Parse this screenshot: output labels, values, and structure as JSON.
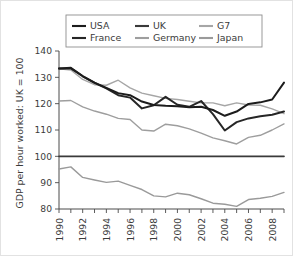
{
  "chart_data": {
    "type": "line",
    "title": "",
    "xlabel": "",
    "ylabel": "GDP per hour worked: UK = 100",
    "xlim": [
      1990,
      2009
    ],
    "ylim": [
      80,
      140
    ],
    "grid": false,
    "legend_position": "top",
    "x_tick_labels": [
      "1990",
      "1992",
      "1994",
      "1996",
      "1998",
      "2000",
      "2002",
      "2004",
      "2006",
      "2008"
    ],
    "x_tick_values": [
      1990,
      1992,
      1994,
      1996,
      1998,
      2000,
      2002,
      2004,
      2006,
      2008
    ],
    "x_minor_ticks": [
      1990,
      1991,
      1992,
      1993,
      1994,
      1995,
      1996,
      1997,
      1998,
      1999,
      2000,
      2001,
      2002,
      2003,
      2004,
      2005,
      2006,
      2007,
      2008,
      2009
    ],
    "y_tick_labels": [
      "80",
      "90",
      "100",
      "110",
      "120",
      "130",
      "140"
    ],
    "y_tick_values": [
      80,
      90,
      100,
      110,
      120,
      130,
      140
    ],
    "x": [
      1990,
      1991,
      1992,
      1993,
      1994,
      1995,
      1996,
      1997,
      1998,
      1999,
      2000,
      2001,
      2002,
      2003,
      2004,
      2005,
      2006,
      2007,
      2008,
      2009
    ],
    "series": [
      {
        "name": "USA",
        "color": "#1c1c1c",
        "width": 2.0,
        "values": [
          133.4,
          133.6,
          130.5,
          128.0,
          126.0,
          124.0,
          123.2,
          120.8,
          119.5,
          119.2,
          119.0,
          118.6,
          118.8,
          117.6,
          115.4,
          117.0,
          119.9,
          120.5,
          121.6,
          128.0
        ]
      },
      {
        "name": "UK",
        "color": "#3a3a3a",
        "width": 1.7,
        "values": [
          100,
          100,
          100,
          100,
          100,
          100,
          100,
          100,
          100,
          100,
          100,
          100,
          100,
          100,
          100,
          100,
          100,
          100,
          100,
          100
        ]
      },
      {
        "name": "G7",
        "color": "#a6a6a6",
        "width": 1.4,
        "values": [
          133.2,
          132.8,
          129.2,
          127.2,
          127.0,
          128.9,
          126.0,
          124.0,
          123.0,
          122.0,
          121.6,
          120.9,
          120.3,
          120.3,
          119.2,
          120.3,
          119.5,
          119.4,
          118.0,
          116.2
        ]
      },
      {
        "name": "France",
        "color": "#262626",
        "width": 2.0,
        "values": [
          133.4,
          133.4,
          130.4,
          127.9,
          125.8,
          123.2,
          122.3,
          118.2,
          119.4,
          122.6,
          119.6,
          118.8,
          121.0,
          116.0,
          109.8,
          113.0,
          114.4,
          115.2,
          115.8,
          117.0
        ]
      },
      {
        "name": "Germany",
        "color": "#9e9e9e",
        "width": 1.4,
        "values": [
          121.0,
          121.2,
          118.8,
          117.2,
          116.0,
          114.4,
          114.0,
          110.0,
          109.6,
          112.2,
          111.6,
          110.4,
          108.8,
          107.0,
          105.9,
          104.7,
          107.2,
          108.0,
          110.0,
          112.3
        ]
      },
      {
        "name": "Japan",
        "color": "#9a9a9a",
        "width": 1.4,
        "values": [
          95.2,
          96.0,
          92.0,
          91.0,
          90.1,
          90.6,
          89.0,
          87.4,
          85.0,
          84.6,
          86.0,
          85.4,
          83.9,
          82.2,
          81.8,
          81.0,
          83.6,
          84.1,
          84.8,
          86.3
        ]
      }
    ]
  },
  "legend": {
    "entries": [
      {
        "label": "USA",
        "color": "#1c1c1c"
      },
      {
        "label": "UK",
        "color": "#3a3a3a"
      },
      {
        "label": "G7",
        "color": "#a6a6a6"
      },
      {
        "label": "France",
        "color": "#262626"
      },
      {
        "label": "Germany",
        "color": "#9e9e9e"
      },
      {
        "label": "Japan",
        "color": "#9a9a9a"
      }
    ]
  }
}
